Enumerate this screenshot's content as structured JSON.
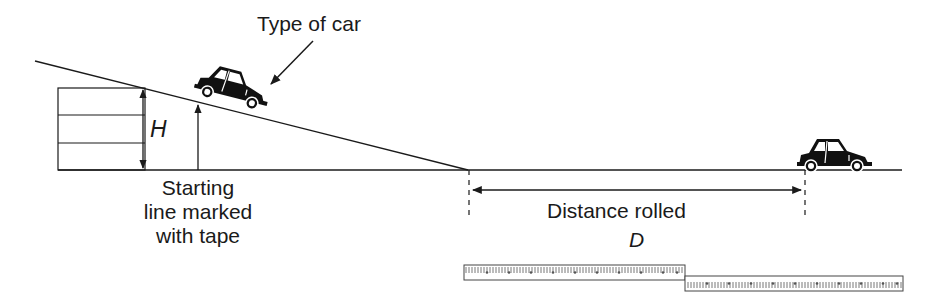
{
  "diagram": {
    "type": "physics-experiment-setup",
    "labels": {
      "car_type": "Type of car",
      "height_var": "H",
      "starting_line": [
        "Starting",
        "line marked",
        "with tape"
      ],
      "distance": "Distance rolled",
      "distance_var": "D"
    },
    "elements": [
      {
        "id": "ramp",
        "description": "inclined plane resting on stacked blocks"
      },
      {
        "id": "blocks",
        "count": 3
      },
      {
        "id": "car-on-ramp",
        "description": "toy car at top of ramp"
      },
      {
        "id": "car-stopped",
        "description": "toy car at final position"
      },
      {
        "id": "height-arrow",
        "description": "double arrow showing height H"
      },
      {
        "id": "starting-line-arrow",
        "description": "arrow pointing to starting line"
      },
      {
        "id": "distance-arrow",
        "description": "double arrow showing distance D"
      },
      {
        "id": "meter-sticks",
        "count": 2
      }
    ],
    "colors": {
      "ink": "#1a1a1a",
      "background": "#ffffff"
    }
  }
}
